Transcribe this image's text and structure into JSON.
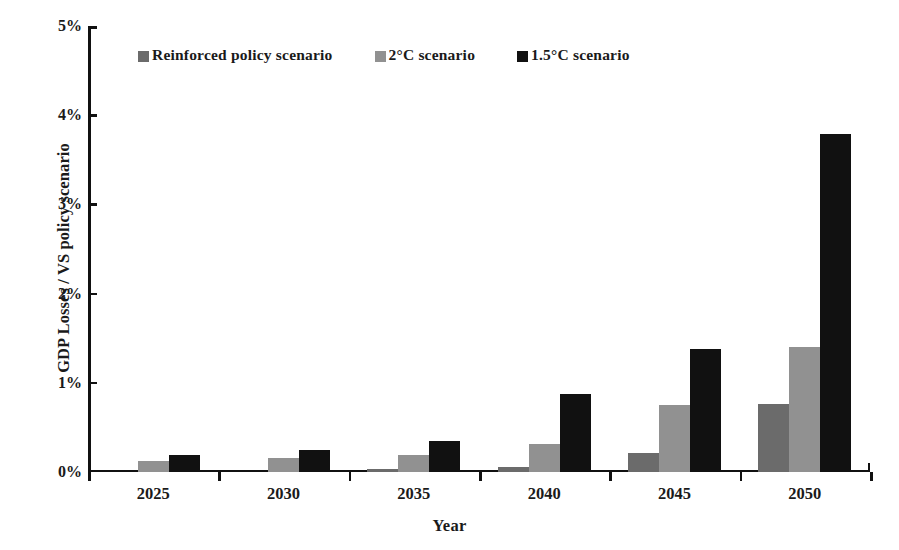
{
  "chart_data": {
    "type": "bar",
    "title": "",
    "xlabel": "Year",
    "ylabel": "GDP Losses / VS policy scenario",
    "categories": [
      "2025",
      "2030",
      "2035",
      "2040",
      "2045",
      "2050"
    ],
    "ylim": [
      0,
      5
    ],
    "y_unit": "%",
    "y_ticks": [
      "0%",
      "1%",
      "2%",
      "3%",
      "4%",
      "5%"
    ],
    "y_tick_values": [
      0,
      1,
      2,
      3,
      4,
      5
    ],
    "grid": false,
    "legend_position": "top-left-inside",
    "series": [
      {
        "name": "Reinforced policy scenario",
        "color": "#6b6b6b",
        "values": [
          0.0,
          0.0,
          0.03,
          0.06,
          0.21,
          0.76
        ]
      },
      {
        "name": "2°C scenario",
        "color": "#919191",
        "values": [
          0.12,
          0.16,
          0.19,
          0.31,
          0.75,
          1.4
        ]
      },
      {
        "name": "1.5°C scenario",
        "color": "#111111",
        "values": [
          0.19,
          0.25,
          0.35,
          0.88,
          1.38,
          3.79
        ]
      }
    ]
  },
  "legend": {
    "items": [
      {
        "label": "Reinforced policy scenario",
        "swatch_class": "sw0"
      },
      {
        "label": "2°C scenario",
        "swatch_class": "sw1"
      },
      {
        "label": "1.5°C scenario",
        "swatch_class": "sw2"
      }
    ]
  },
  "axes": {
    "y_title": "GDP Losses / VS policy scenario",
    "x_title": "Year"
  },
  "colors": {
    "series_0": "#6b6b6b",
    "series_1": "#919191",
    "series_2": "#111111",
    "axis": "#111111",
    "background": "#ffffff"
  }
}
